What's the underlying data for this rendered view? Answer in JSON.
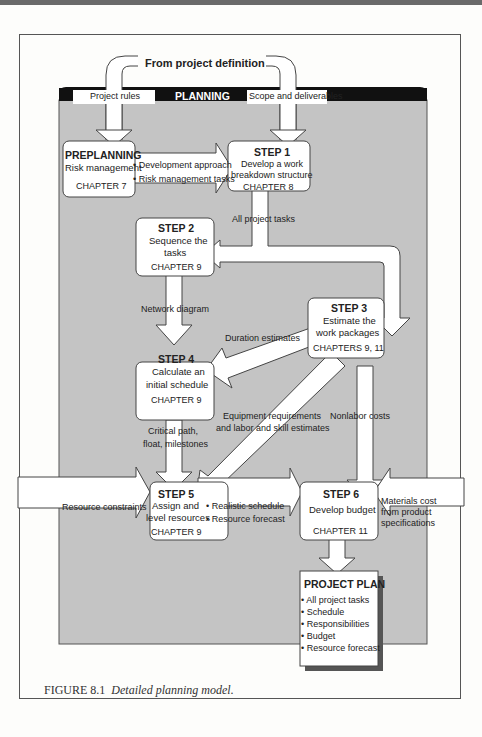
{
  "source": {
    "label": "From project definition"
  },
  "planning_band": {
    "title": "PLANNING",
    "left_input": "Project rules",
    "right_input": "Scope and deliverables"
  },
  "preplanning": {
    "title": "PREPLANNING",
    "subtitle": "Risk management",
    "chapter": "CHAPTER 7",
    "outputs": [
      "• Development approach",
      "• Risk management tasks"
    ]
  },
  "steps": [
    {
      "title": "STEP 1",
      "line1": "Develop a work",
      "line2": "breakdown structure",
      "chapter": "CHAPTER 8"
    },
    {
      "title": "STEP 2",
      "line1": "Sequence the",
      "line2": "tasks",
      "chapter": "CHAPTER 9"
    },
    {
      "title": "STEP 3",
      "line1": "Estimate the",
      "line2": "work packages",
      "chapter": "CHAPTERS 9, 11"
    },
    {
      "title": "STEP 4",
      "line1": "Calculate an",
      "line2": "initial schedule",
      "chapter": "CHAPTER 9"
    },
    {
      "title": "STEP 5",
      "line1": "Assign and",
      "line2": "level resources",
      "chapter": "CHAPTER 9"
    },
    {
      "title": "STEP 6",
      "line1": "Develop budget",
      "line2": "",
      "chapter": "CHAPTER 11"
    }
  ],
  "flows": {
    "all_tasks": "All project tasks",
    "network": "Network diagram",
    "duration": "Duration estimates",
    "critical1": "Critical path,",
    "critical2": "float, milestones",
    "equip1": "Equipment requirements",
    "equip2": "and labor and skill estimates",
    "nonlabor": "Nonlabor costs",
    "resource_constraints": "Resource constraints",
    "step5_out": [
      "• Realistic schedule",
      "• Resource forecast"
    ],
    "materials": [
      "Materials cost",
      "from product",
      "specifications"
    ]
  },
  "project_plan": {
    "title": "PROJECT PLAN",
    "items": [
      "• All project tasks",
      "• Schedule",
      "• Responsibilities",
      "• Budget",
      "• Resource forecast"
    ]
  },
  "caption": {
    "label": "FIGURE 8.1",
    "text": "Detailed planning model."
  },
  "colors": {
    "band": "#111111",
    "panel": "#c4c4c4",
    "box": "#ffffff",
    "stroke": "#444444"
  }
}
